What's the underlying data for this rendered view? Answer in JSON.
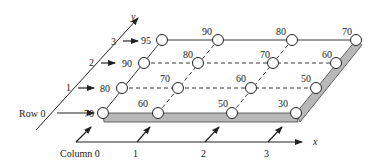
{
  "diagram": {
    "type": "2D grid in perspective with row/column indexing",
    "axes": {
      "x_label": "x",
      "y_label": "y"
    },
    "row_labels": [
      "Row 0",
      "1",
      "2",
      "3"
    ],
    "column_labels": [
      "Column 0",
      "1",
      "2",
      "3"
    ],
    "grid_values": [
      [
        70,
        60,
        50,
        30
      ],
      [
        80,
        70,
        60,
        50
      ],
      [
        90,
        80,
        70,
        60
      ],
      [
        95,
        90,
        80,
        70
      ]
    ],
    "colors": {
      "line": "#222222",
      "slab_fill": "#b8b8b8",
      "node_fill": "#ffffff"
    }
  }
}
